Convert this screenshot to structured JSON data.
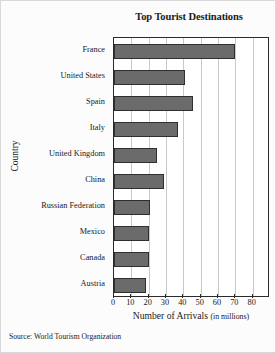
{
  "chart_data": {
    "type": "bar",
    "orientation": "horizontal",
    "title": "Top Tourist Destinations",
    "xlabel": "Number of Arrivals",
    "xlabel_unit": "(in millions)",
    "ylabel": "Country",
    "categories": [
      "France",
      "United States",
      "Spain",
      "Italy",
      "United Kingdom",
      "China",
      "Russian Federation",
      "Mexico",
      "Canada",
      "Austria"
    ],
    "values": [
      70,
      41,
      45.5,
      37,
      25,
      29,
      21,
      20,
      20,
      18.5
    ],
    "xlim": [
      0,
      90
    ],
    "xticks": [
      0,
      10,
      20,
      30,
      40,
      50,
      60,
      70,
      80
    ],
    "xticklabels": [
      "0",
      "10",
      "20",
      "30",
      "40",
      "50",
      "60",
      "70",
      "80"
    ],
    "grid": "vertical",
    "legend": "none",
    "bar_color": "#6b6b6b",
    "bar_edge_color": "#2f2f2f",
    "grid_color": "#c9c9c9",
    "axis_color": "#2a2a2a",
    "background_color": "#fcfcfc"
  },
  "source": {
    "text": "Source: World Tourism Organization"
  }
}
